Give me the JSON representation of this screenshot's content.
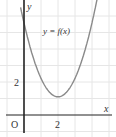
{
  "chart_data": {
    "type": "line",
    "title": "",
    "xlabel": "x",
    "ylabel": "y",
    "origin_label": "O",
    "curve_label": "y = f(x)",
    "x_ticks": [
      {
        "value": 2,
        "label": "2"
      }
    ],
    "y_ticks": [
      {
        "value": 2,
        "label": "2"
      }
    ],
    "xlim": [
      -1.4,
      5.4
    ],
    "ylim": [
      -1.3,
      7.0
    ],
    "grid": true,
    "grid_step": 1,
    "series": [
      {
        "name": "y = f(x)",
        "description": "upward parabola with minimum near (2, 1.1)",
        "x": [
          -0.15,
          0,
          0.5,
          1,
          1.5,
          2,
          2.5,
          3,
          3.5,
          4,
          4.3
        ],
        "values": [
          6.2,
          5.5,
          3.6,
          2.2,
          1.4,
          1.1,
          1.4,
          2.2,
          3.6,
          5.5,
          7.0
        ]
      }
    ],
    "colors": {
      "curve": "#8a8a8a",
      "axes": "#222222",
      "grid": "#e6e6e6"
    }
  }
}
